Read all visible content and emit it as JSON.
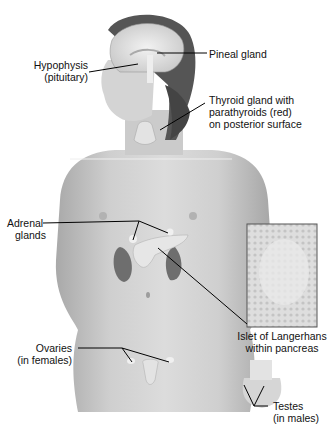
{
  "figure": {
    "labels": {
      "pineal": "Pineal gland",
      "hypophysis_1": "Hypophysis",
      "hypophysis_2": "(pituitary)",
      "thyroid_1": "Thyroid gland with",
      "thyroid_2": "parathyroids (red)",
      "thyroid_3": "on posterior surface",
      "adrenal_1": "Adrenal",
      "adrenal_2": "glands",
      "islet_1": "Islet of Langerhans",
      "islet_2": "within pancreas",
      "ovaries_1": "Ovaries",
      "ovaries_2": "(in females)",
      "testes_1": "Testes",
      "testes_2": "(in males)"
    }
  }
}
